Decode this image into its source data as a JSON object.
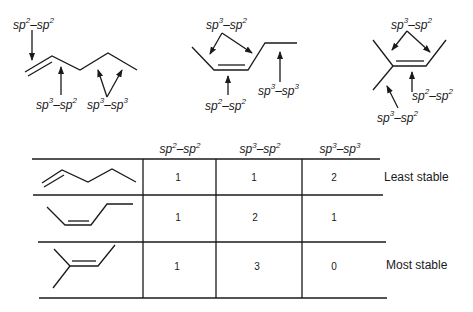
{
  "diagrams": {
    "left": {
      "molecule": "1-pentene",
      "labels": {
        "top": {
          "a": "sp",
          "a_sup": "2",
          "b": "sp",
          "b_sup": "2"
        },
        "bottom_mid": {
          "a": "sp",
          "a_sup": "3",
          "b": "sp",
          "b_sup": "2"
        },
        "bottom_right": {
          "a": "sp",
          "a_sup": "3",
          "b": "sp",
          "b_sup": "3"
        }
      }
    },
    "middle": {
      "molecule": "cis-2-pentene",
      "labels": {
        "top": {
          "a": "sp",
          "a_sup": "3",
          "b": "sp",
          "b_sup": "2"
        },
        "bottom_mid": {
          "a": "sp",
          "a_sup": "2",
          "b": "sp",
          "b_sup": "2"
        },
        "right": {
          "a": "sp",
          "a_sup": "3",
          "b": "sp",
          "b_sup": "3"
        }
      }
    },
    "right": {
      "molecule": "2-methyl-2-butene",
      "labels": {
        "top": {
          "a": "sp",
          "a_sup": "3",
          "b": "sp",
          "b_sup": "2"
        },
        "right": {
          "a": "sp",
          "a_sup": "2",
          "b": "sp",
          "b_sup": "2"
        },
        "bottom": {
          "a": "sp",
          "a_sup": "3",
          "b": "sp",
          "b_sup": "2"
        }
      }
    }
  },
  "table": {
    "headers": [
      {
        "a": "sp",
        "a_sup": "2",
        "b": "sp",
        "b_sup": "2"
      },
      {
        "a": "sp",
        "a_sup": "3",
        "b": "sp",
        "b_sup": "2"
      },
      {
        "a": "sp",
        "a_sup": "3",
        "b": "sp",
        "b_sup": "3"
      }
    ],
    "rows": [
      {
        "molecule": "1-pentene",
        "values": [
          "1",
          "1",
          "2"
        ],
        "stability": "Least stable"
      },
      {
        "molecule": "cis-2-pentene",
        "values": [
          "1",
          "2",
          "1"
        ],
        "stability": ""
      },
      {
        "molecule": "2-methyl-2-butene",
        "values": [
          "1",
          "3",
          "0"
        ],
        "stability": "Most stable"
      }
    ]
  },
  "dash": "–"
}
